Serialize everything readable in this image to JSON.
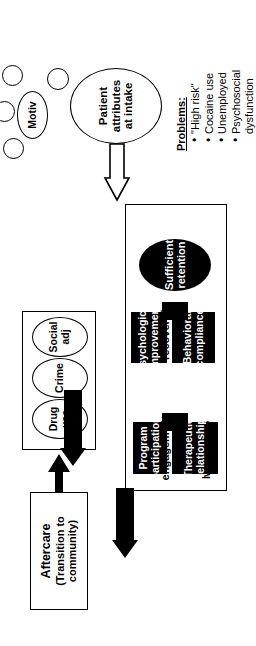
{
  "figure": {
    "type": "flowchart",
    "orientation": "rotated-90-counterclockwise",
    "colors": {
      "ink": "#000000",
      "paper": "#ffffff",
      "filled_node": "#000000",
      "filled_node_text": "#ffffff"
    }
  },
  "aftercare": {
    "title": "Aftercare",
    "subtitle": "(Transition to\ncommunity)",
    "subtitle_line1": "(Transition to",
    "subtitle_line2": "community)"
  },
  "outcomes": {
    "nodes": [
      {
        "label": "Drug use"
      },
      {
        "label": "Crime"
      },
      {
        "label": "Social adj"
      }
    ]
  },
  "treatment": {
    "months_label": "Months 1-3",
    "phases": [
      {
        "label_line1": "Early",
        "label_line2": "engagement"
      },
      {
        "label_line1": "Early",
        "label_line2": "recovery"
      }
    ],
    "early_engagement": {
      "upper": {
        "line1": "Therapeutic",
        "line2": "relationship"
      },
      "lower": {
        "line1": "Program",
        "line2": "participation"
      }
    },
    "early_recovery": {
      "upper": {
        "line1": "Behavioral",
        "line2": "compliance"
      },
      "lower": {
        "line1": "Psychological",
        "line2": "improvement"
      }
    },
    "retention": {
      "line1": "Sufficient",
      "line2": "retention"
    }
  },
  "intake": {
    "patient": {
      "line1": "Patient",
      "line2": "attributes",
      "line3": "at intake"
    },
    "motivation": {
      "label": "Motiv"
    },
    "unlabeled_circles": 4,
    "problems": {
      "heading": "Problems:",
      "items": [
        "\"High risk\"",
        "Cocaine use",
        "Unemployed",
        "Psychosocial dysfunction"
      ]
    }
  }
}
